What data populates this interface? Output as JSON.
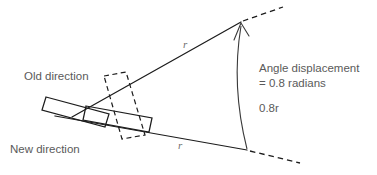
{
  "diagram": {
    "labels": {
      "old_direction": "Old direction",
      "new_direction": "New direction",
      "angle_displacement_line1": "Angle displacement",
      "angle_displacement_line2": "= 0.8 radians",
      "arc_length": "0.8r",
      "radius_upper": "r",
      "radius_lower": "r"
    },
    "values": {
      "angle_radians": 0.8,
      "arc_length_expression": "0.8r",
      "radius_symbol": "r"
    },
    "colors": {
      "background": "#ffffff",
      "line": "#1c1c1c",
      "arc": "#3a3a3a",
      "text": "#5a5a5a",
      "radius_label": "#6e6e6e"
    },
    "geometry": {
      "vertex_upper": [
        241,
        22
      ],
      "vertex_lower": [
        247,
        150
      ],
      "arc_bulge": [
        232,
        86
      ],
      "upper_ray_start": [
        78,
        112
      ],
      "lower_ray_start": [
        60,
        118
      ]
    }
  }
}
